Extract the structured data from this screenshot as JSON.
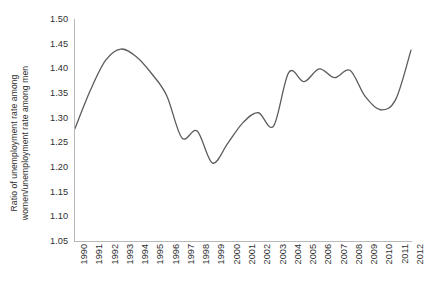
{
  "chart_data": {
    "type": "line",
    "title": "",
    "subtitle": "",
    "xlabel": "",
    "ylabel": "Ratio of unemployment rate among women/unemployment rate among men",
    "ylabel_lines": [
      "Ratio of unemployment rate among",
      "women/unemployment rate among men"
    ],
    "ylim": [
      1.05,
      1.5
    ],
    "ytick_step": 0.05,
    "ytick_labels": [
      "1.50",
      "1.45",
      "1.40",
      "1.35",
      "1.30",
      "1.25",
      "1.20",
      "1.15",
      "1.10",
      "1.05"
    ],
    "ytick_values": [
      1.5,
      1.45,
      1.4,
      1.35,
      1.3,
      1.25,
      1.2,
      1.15,
      1.1,
      1.05
    ],
    "xlim": [
      1990,
      2012
    ],
    "categories": [
      "1990",
      "1991",
      "1992",
      "1993",
      "1994",
      "1995",
      "1996",
      "1997",
      "1998",
      "1999",
      "2000",
      "2001",
      "2002",
      "2003",
      "2004",
      "2005",
      "2006",
      "2007",
      "2008",
      "2009",
      "2010",
      "2011",
      "2012"
    ],
    "x": [
      1990,
      1991,
      1992,
      1993,
      1994,
      1995,
      1996,
      1997,
      1998,
      1999,
      2000,
      2001,
      2002,
      2003,
      2004,
      2005,
      2006,
      2007,
      2008,
      2009,
      2010,
      2011,
      2012
    ],
    "values": [
      1.278,
      1.355,
      1.416,
      1.439,
      1.424,
      1.39,
      1.345,
      1.259,
      1.273,
      1.208,
      1.248,
      1.29,
      1.31,
      1.283,
      1.392,
      1.373,
      1.399,
      1.381,
      1.396,
      1.343,
      1.316,
      1.337,
      1.437
    ],
    "series": [
      {
        "name": "Ratio of unemployment rate among women/unemployment rate among men",
        "values": [
          1.278,
          1.355,
          1.416,
          1.439,
          1.424,
          1.39,
          1.345,
          1.259,
          1.273,
          1.208,
          1.248,
          1.29,
          1.31,
          1.283,
          1.392,
          1.373,
          1.399,
          1.381,
          1.396,
          1.343,
          1.316,
          1.337,
          1.437
        ],
        "color": "#5b5b5b"
      }
    ],
    "grid": false,
    "legend": false,
    "legend_position": "none",
    "line_color": "#5b5b5b",
    "line_width": 1.3,
    "smoothing": "spline",
    "axis_color": "#b9b9b9",
    "background": "#ffffff",
    "annotations": []
  }
}
